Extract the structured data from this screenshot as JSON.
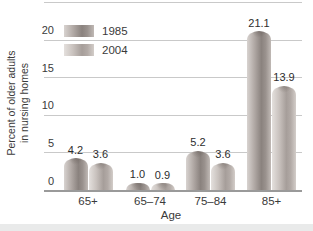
{
  "page": {
    "background": "#ffffff",
    "bottom_band_color": "#e9eaea"
  },
  "axes": {
    "y_title_line1": "Percent of older adults",
    "y_title_line2": "in nursing homes",
    "x_title": "Age"
  },
  "colors": {
    "text": "#3a3a3a",
    "gridline": "#c9c9c9",
    "axis_line": "#9a9a9a",
    "series": {
      "1985": {
        "light": "#d8d3d0",
        "mid1": "#b2aaa6",
        "dark": "#8a827e",
        "mid2": "#9a928e",
        "edge": "#c0b9b5"
      },
      "2004": {
        "light": "#e4e0dd",
        "mid1": "#c9c2be",
        "dark": "#a69e9a",
        "mid2": "#b2aaa6",
        "edge": "#d3cdc9"
      }
    }
  },
  "chart_data": {
    "type": "bar",
    "categories": [
      "65+",
      "65–74",
      "75–84",
      "85+"
    ],
    "series": [
      {
        "name": "1985",
        "values": [
          4.2,
          1.0,
          5.2,
          21.1
        ]
      },
      {
        "name": "2004",
        "values": [
          3.6,
          0.9,
          3.6,
          13.9
        ]
      }
    ],
    "value_labels": [
      [
        "4.2",
        "1.0",
        "5.2",
        "21.1"
      ],
      [
        "3.6",
        "0.9",
        "3.6",
        "13.9"
      ]
    ],
    "xlabel": "Age",
    "ylabel": "Percent of older adults in nursing homes",
    "ylim": [
      0,
      25
    ],
    "yticks": [
      0,
      5,
      10,
      15,
      20,
      25
    ],
    "grid": true,
    "legend_position": "top-left"
  }
}
